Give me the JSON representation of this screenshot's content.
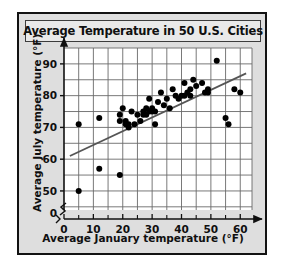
{
  "figure": {
    "title": "Average Temperature in 50 U.S. Cities",
    "xlabel": "Average January temperature (°F)",
    "ylabel": "Average July temperature (°F)",
    "frame_color": "#121212",
    "background_color": "#dedede",
    "plot_background_color": "#ffffff",
    "grid_color": "#6a6a6a",
    "point_color": "#000000",
    "trendline_color": "#555555"
  },
  "axes": {
    "x_origin_label": "0",
    "y_origin_label": "0",
    "x_ticks": [
      "0",
      "10",
      "20",
      "30",
      "40",
      "50",
      "60"
    ],
    "y_ticks": [
      "50",
      "60",
      "70",
      "80",
      "90"
    ],
    "axis_break": "zigzag"
  },
  "chart_data": {
    "type": "scatter",
    "title": "Average Temperature in 50 U.S. Cities",
    "xlabel": "Average January temperature (°F)",
    "ylabel": "Average July temperature (°F)",
    "xlim": [
      0,
      64
    ],
    "ylim": [
      44,
      95
    ],
    "x_ticks": [
      0,
      10,
      20,
      30,
      40,
      50,
      60
    ],
    "y_ticks": [
      50,
      60,
      70,
      80,
      90
    ],
    "grid": true,
    "legend": "none",
    "axis_break_y": true,
    "points": [
      [
        5,
        50
      ],
      [
        5,
        71
      ],
      [
        12,
        57
      ],
      [
        12,
        73
      ],
      [
        19,
        55
      ],
      [
        19,
        72
      ],
      [
        19,
        74
      ],
      [
        20,
        76
      ],
      [
        21,
        72
      ],
      [
        21,
        71
      ],
      [
        22,
        70
      ],
      [
        22,
        71
      ],
      [
        23,
        75
      ],
      [
        24,
        71
      ],
      [
        25,
        74
      ],
      [
        26,
        72
      ],
      [
        27,
        74
      ],
      [
        27,
        75
      ],
      [
        28,
        76
      ],
      [
        28,
        74
      ],
      [
        29,
        75
      ],
      [
        29,
        79
      ],
      [
        30,
        75
      ],
      [
        30,
        76
      ],
      [
        31,
        71
      ],
      [
        31,
        75
      ],
      [
        32,
        78
      ],
      [
        33,
        81
      ],
      [
        34,
        77
      ],
      [
        35,
        79
      ],
      [
        36,
        76
      ],
      [
        37,
        82
      ],
      [
        38,
        80
      ],
      [
        39,
        79
      ],
      [
        40,
        80
      ],
      [
        41,
        84
      ],
      [
        41,
        80
      ],
      [
        42,
        81
      ],
      [
        43,
        80
      ],
      [
        43,
        82
      ],
      [
        44,
        85
      ],
      [
        45,
        83
      ],
      [
        47,
        84
      ],
      [
        48,
        81
      ],
      [
        49,
        82
      ],
      [
        49,
        81
      ],
      [
        52,
        91
      ],
      [
        55,
        73
      ],
      [
        56,
        71
      ],
      [
        58,
        82
      ],
      [
        60,
        81
      ]
    ],
    "trendline": {
      "x": [
        2,
        62
      ],
      "y": [
        61,
        87
      ]
    }
  }
}
